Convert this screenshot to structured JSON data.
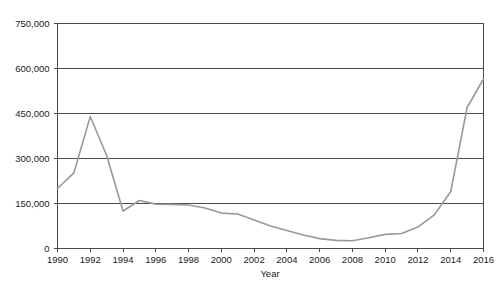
{
  "chart_data": {
    "type": "line",
    "title": "",
    "xlabel": "Year",
    "ylabel": "",
    "xlim": [
      1990,
      2016
    ],
    "ylim": [
      0,
      750000
    ],
    "grid": true,
    "legend": false,
    "line_color": "#999999",
    "background_color": "#ffffff",
    "axis_color": "#4a4a4a",
    "x": [
      1990,
      1991,
      1992,
      1993,
      1994,
      1995,
      1996,
      1997,
      1998,
      1999,
      2000,
      2001,
      2002,
      2003,
      2004,
      2005,
      2006,
      2007,
      2008,
      2009,
      2010,
      2011,
      2012,
      2013,
      2014,
      2015,
      2016
    ],
    "values": [
      200000,
      252000,
      440000,
      310000,
      125000,
      160000,
      148000,
      147000,
      145000,
      135000,
      118000,
      115000,
      95000,
      75000,
      60000,
      45000,
      33000,
      27000,
      26000,
      36000,
      47000,
      50000,
      72000,
      112000,
      190000,
      470000,
      565000
    ],
    "series": [
      {
        "name": "series-1",
        "values": [
          200000,
          252000,
          440000,
          310000,
          125000,
          160000,
          148000,
          147000,
          145000,
          135000,
          118000,
          115000,
          95000,
          75000,
          60000,
          45000,
          33000,
          27000,
          26000,
          36000,
          47000,
          50000,
          72000,
          112000,
          190000,
          470000,
          565000
        ]
      }
    ],
    "ytick_labels": [
      "0",
      "150,000",
      "300,000",
      "450,000",
      "600,000",
      "750,000"
    ],
    "ytick_values": [
      0,
      150000,
      300000,
      450000,
      600000,
      750000
    ],
    "xtick_labels": [
      "1990",
      "1992",
      "1994",
      "1996",
      "1998",
      "2000",
      "2002",
      "2004",
      "2006",
      "2008",
      "2010",
      "2012",
      "2014",
      "2016"
    ],
    "xtick_values": [
      1990,
      1992,
      1994,
      1996,
      1998,
      2000,
      2002,
      2004,
      2006,
      2008,
      2010,
      2012,
      2014,
      2016
    ]
  },
  "caption": {
    "text": ""
  }
}
